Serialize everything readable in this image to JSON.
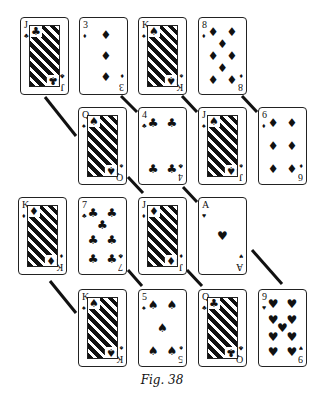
{
  "figure": {
    "caption": "Fig. 38",
    "card_size": {
      "w": 49,
      "h": 78
    },
    "rows": [
      {
        "row": 1,
        "cards": [
          {
            "rank": "J",
            "suit": "clubs",
            "glyph": "♣",
            "face": true,
            "x": 20,
            "y": 17
          },
          {
            "rank": "3",
            "suit": "diamonds",
            "glyph": "♦",
            "face": false,
            "x": 79,
            "y": 17
          },
          {
            "rank": "K",
            "suit": "spades",
            "glyph": "♠",
            "face": true,
            "x": 138,
            "y": 17
          },
          {
            "rank": "8",
            "suit": "diamonds",
            "glyph": "♦",
            "face": false,
            "x": 198,
            "y": 17
          }
        ]
      },
      {
        "row": 2,
        "cards": [
          {
            "rank": "Q",
            "suit": "spades",
            "glyph": "♠",
            "face": true,
            "x": 78,
            "y": 107
          },
          {
            "rank": "4",
            "suit": "clubs",
            "glyph": "♣",
            "face": false,
            "x": 138,
            "y": 107
          },
          {
            "rank": "J",
            "suit": "spades",
            "glyph": "♠",
            "face": true,
            "x": 198,
            "y": 107
          },
          {
            "rank": "6",
            "suit": "diamonds",
            "glyph": "♦",
            "face": false,
            "x": 258,
            "y": 107
          }
        ]
      },
      {
        "row": 3,
        "cards": [
          {
            "rank": "K",
            "suit": "diamonds",
            "glyph": "♦",
            "face": true,
            "x": 18,
            "y": 197
          },
          {
            "rank": "7",
            "suit": "clubs",
            "glyph": "♣",
            "face": false,
            "x": 78,
            "y": 197
          },
          {
            "rank": "J",
            "suit": "diamonds",
            "glyph": "♦",
            "face": true,
            "x": 138,
            "y": 197
          },
          {
            "rank": "A",
            "suit": "hearts",
            "glyph": "♥",
            "face": false,
            "x": 198,
            "y": 197
          }
        ]
      },
      {
        "row": 4,
        "cards": [
          {
            "rank": "K",
            "suit": "spades",
            "glyph": "♠",
            "face": true,
            "x": 78,
            "y": 289
          },
          {
            "rank": "5",
            "suit": "spades",
            "glyph": "♠",
            "face": false,
            "x": 138,
            "y": 289
          },
          {
            "rank": "Q",
            "suit": "clubs",
            "glyph": "♣",
            "face": true,
            "x": 198,
            "y": 289
          },
          {
            "rank": "9",
            "suit": "hearts",
            "glyph": "♥",
            "face": false,
            "x": 258,
            "y": 289
          }
        ]
      }
    ],
    "connectors": [
      {
        "from": "J♣",
        "to": "Q♠"
      },
      {
        "from": "3♦",
        "to": "4♣"
      },
      {
        "from": "K♠",
        "to": "J♠"
      },
      {
        "from": "8♦",
        "to": "6♦"
      },
      {
        "from": "Q♠",
        "to": "7♣"
      },
      {
        "from": "4♣",
        "to": "J♦"
      },
      {
        "from": "K♦",
        "to": "K♠"
      },
      {
        "from": "7♣",
        "to": "5♠"
      },
      {
        "from": "J♦",
        "to": "Q♣"
      },
      {
        "from": "A♥",
        "to": "9♥"
      }
    ],
    "colors": {
      "ink": "#111111",
      "background": "#ffffff"
    }
  }
}
